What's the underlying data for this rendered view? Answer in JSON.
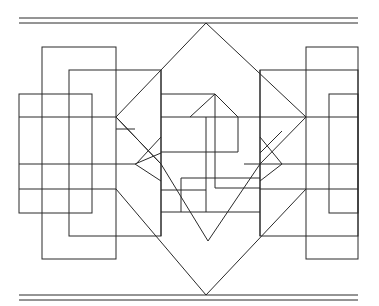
{
  "figure": {
    "type": "geometric-line-drawing",
    "stroke_color": "#2a2a2a",
    "background_color": "#ffffff"
  }
}
